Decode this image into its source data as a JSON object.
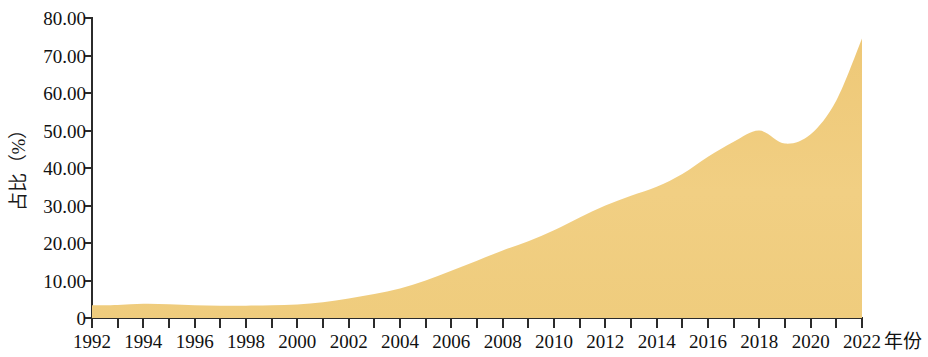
{
  "chart_data": {
    "type": "area",
    "title": "",
    "subtitle": "",
    "xlabel": "年份",
    "ylabel": "占比（%）",
    "xlim": [
      1992,
      2022
    ],
    "ylim": [
      0,
      80
    ],
    "grid": false,
    "legend": null,
    "legend_position": "none",
    "fill_color": "#F0CC7E",
    "fill_color_light": "#F6DCA2",
    "axis_color": "#2B2B2B",
    "background": "#FFFFFF",
    "y_ticks": [
      0,
      10,
      20,
      30,
      40,
      50,
      60,
      70,
      80
    ],
    "y_tick_labels": [
      "0",
      "10.00",
      "20.00",
      "30.00",
      "40.00",
      "50.00",
      "60.00",
      "70.00",
      "80.00"
    ],
    "x_ticks": [
      1992,
      1993,
      1994,
      1995,
      1996,
      1997,
      1998,
      1999,
      2000,
      2001,
      2002,
      2003,
      2004,
      2005,
      2006,
      2007,
      2008,
      2009,
      2010,
      2011,
      2012,
      2013,
      2014,
      2015,
      2016,
      2017,
      2018,
      2019,
      2020,
      2021,
      2022
    ],
    "x_tick_labels": [
      "1992",
      "1994",
      "1996",
      "1998",
      "2000",
      "2002",
      "2004",
      "2006",
      "2008",
      "2010",
      "2012",
      "2014",
      "2016",
      "2018",
      "2020",
      "2022"
    ],
    "x_tick_label_years": [
      1992,
      1994,
      1996,
      1998,
      2000,
      2002,
      2004,
      2006,
      2008,
      2010,
      2012,
      2014,
      2016,
      2018,
      2020,
      2022
    ],
    "x": [
      1992,
      1993,
      1994,
      1995,
      1996,
      1997,
      1998,
      1999,
      2000,
      2001,
      2002,
      2003,
      2004,
      2005,
      2006,
      2007,
      2008,
      2009,
      2010,
      2011,
      2012,
      2013,
      2014,
      2015,
      2016,
      2017,
      2018,
      2019,
      2020,
      2021,
      2022
    ],
    "values": [
      3.4,
      3.5,
      3.8,
      3.7,
      3.4,
      3.3,
      3.3,
      3.4,
      3.6,
      4.2,
      5.2,
      6.4,
      7.9,
      10.0,
      12.6,
      15.3,
      18.0,
      20.5,
      23.4,
      26.8,
      30.0,
      32.6,
      35.0,
      38.4,
      43.0,
      47.0,
      50.0,
      46.5,
      49.0,
      58.0,
      74.5
    ],
    "series": [
      {
        "name": "占比",
        "values": [
          3.4,
          3.5,
          3.8,
          3.7,
          3.4,
          3.3,
          3.3,
          3.4,
          3.6,
          4.2,
          5.2,
          6.4,
          7.9,
          10.0,
          12.6,
          15.3,
          18.0,
          20.5,
          23.4,
          26.8,
          30.0,
          32.6,
          35.0,
          38.4,
          43.0,
          47.0,
          50.0,
          46.5,
          49.0,
          58.0,
          74.5
        ]
      }
    ],
    "annotations": []
  }
}
